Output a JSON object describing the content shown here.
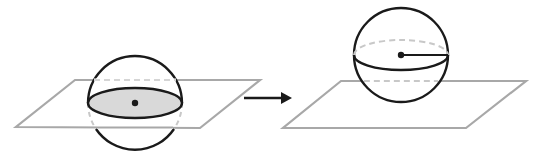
{
  "diagram": {
    "colors": {
      "outline": "#1a1a1a",
      "plane": "#a8a8a8",
      "hidden": "#c8c8c8",
      "section_fill": "#d9d9d9",
      "background": "#ffffff"
    },
    "left_figure": {
      "plane": {
        "points": [
          [
            75,
            80
          ],
          [
            260,
            80
          ],
          [
            200,
            128
          ],
          [
            16,
            127
          ]
        ]
      },
      "sphere": {
        "cx": 135,
        "cy": 103,
        "r": 47
      },
      "cross_section": {
        "cx": 135,
        "cy": 103,
        "rx": 47,
        "ry": 15,
        "shaded": true
      },
      "center_dot": {
        "cx": 135,
        "cy": 103
      }
    },
    "arrow": {
      "x1": 244,
      "y1": 98,
      "x2": 292,
      "y2": 98,
      "direction": "right"
    },
    "right_figure": {
      "plane": {
        "points": [
          [
            341,
            81
          ],
          [
            526,
            81
          ],
          [
            466,
            128
          ],
          [
            283,
            128
          ]
        ]
      },
      "sphere": {
        "cx": 401,
        "cy": 55,
        "r": 47
      },
      "equator": {
        "cx": 401,
        "cy": 55,
        "rx": 47,
        "ry": 15,
        "back_half": "dashed"
      },
      "center_dot": {
        "cx": 401,
        "cy": 55
      },
      "radius_line": {
        "x1": 401,
        "y1": 55,
        "x2": 448,
        "y2": 55
      }
    }
  }
}
